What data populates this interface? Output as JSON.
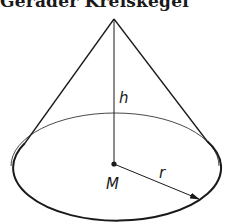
{
  "title": "Gerader Kreiskegel",
  "diagram": {
    "type": "right circular cone",
    "labels": {
      "height": "h",
      "center": "M",
      "radius": "r"
    },
    "colors": {
      "ink": "#1a1a1a",
      "background": "#ffffff"
    }
  }
}
